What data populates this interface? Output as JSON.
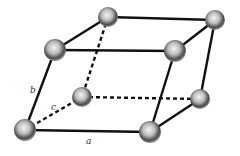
{
  "diagram": {
    "type": "unit-cell-parallelepiped",
    "edge_color": "#111111",
    "atom_color": "#555555",
    "labels": {
      "a": "a",
      "b": "b",
      "c": "c"
    },
    "atoms": [
      {
        "id": "top-back-left",
        "x": 108,
        "y": 17
      },
      {
        "id": "top-back-right",
        "x": 215,
        "y": 20
      },
      {
        "id": "top-front-left",
        "x": 55,
        "y": 50
      },
      {
        "id": "top-front-right",
        "x": 175,
        "y": 51
      },
      {
        "id": "bottom-back-left",
        "x": 82,
        "y": 97
      },
      {
        "id": "bottom-back-right",
        "x": 200,
        "y": 99
      },
      {
        "id": "bottom-front-left",
        "x": 25,
        "y": 130
      },
      {
        "id": "bottom-front-right",
        "x": 150,
        "y": 132
      }
    ],
    "solid_edges": [
      [
        "top-back-left",
        "top-back-right"
      ],
      [
        "top-front-left",
        "top-front-right"
      ],
      [
        "top-front-left",
        "top-back-left"
      ],
      [
        "top-front-right",
        "top-back-right"
      ],
      [
        "top-front-left",
        "bottom-front-left"
      ],
      [
        "top-front-right",
        "bottom-front-right"
      ],
      [
        "top-back-right",
        "bottom-back-right"
      ],
      [
        "bottom-front-left",
        "bottom-front-right"
      ],
      [
        "bottom-front-right",
        "bottom-back-right"
      ]
    ],
    "dashed_edges": [
      [
        "top-back-left",
        "bottom-back-left"
      ],
      [
        "bottom-front-left",
        "bottom-back-left"
      ],
      [
        "bottom-back-left",
        "bottom-back-right"
      ]
    ]
  }
}
